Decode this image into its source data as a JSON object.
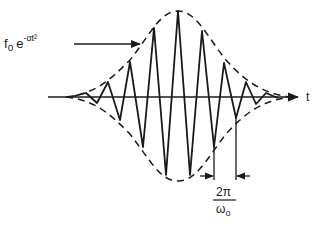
{
  "diagram": {
    "envelope_label": {
      "base": "f",
      "base_sub": "o",
      "exp_base": "e",
      "exponent": "-αt²"
    },
    "axis_label": "t",
    "period_label": {
      "numerator": "2π",
      "denominator": "ω",
      "denominator_sub": "o"
    },
    "colors": {
      "ink": "#1a1a1a",
      "background": "#ffffff"
    }
  }
}
